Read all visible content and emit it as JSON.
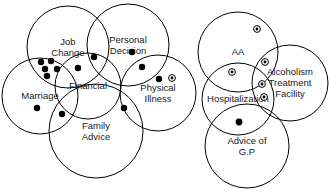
{
  "diagram": {
    "width": 329,
    "height": 194,
    "background_color": "#ffffff",
    "stroke_color": "#000000",
    "label_color": "#1a1a1a",
    "clusters": [
      {
        "name": "left-cluster",
        "circles": [
          {
            "id": "job-change",
            "label": "Job\nChange",
            "label_lines": [
              "Job",
              "Change"
            ],
            "cx": 68,
            "cy": 47,
            "r": 41
          },
          {
            "id": "personal-decision",
            "label": "Personal\nDecision",
            "label_lines": [
              "Personal",
              "Decision"
            ],
            "cx": 128,
            "cy": 45,
            "r": 41
          },
          {
            "id": "marriage",
            "label": "Marriage",
            "label_lines": [
              "Marriage"
            ],
            "cx": 40,
            "cy": 96,
            "r": 38
          },
          {
            "id": "financial",
            "label": "Financial",
            "label_lines": [
              "Financial"
            ],
            "cx": 88,
            "cy": 86,
            "r": 33
          },
          {
            "id": "physical-illness",
            "label": "Physical\nIllness",
            "label_lines": [
              "Physical",
              "Illness"
            ],
            "cx": 158,
            "cy": 93,
            "r": 38
          },
          {
            "id": "family-advice",
            "label": "Family\nAdvice",
            "label_lines": [
              "Family",
              "Advice"
            ],
            "cx": 96,
            "cy": 131,
            "r": 47
          }
        ],
        "markers": [
          {
            "type": "filled",
            "x": 41,
            "y": 62,
            "r": 3.2
          },
          {
            "type": "filled",
            "x": 51,
            "y": 61,
            "r": 3.2
          },
          {
            "type": "filled",
            "x": 45,
            "y": 69,
            "r": 3.2
          },
          {
            "type": "filled",
            "x": 57,
            "y": 69,
            "r": 3.2
          },
          {
            "type": "filled",
            "x": 47,
            "y": 76,
            "r": 3.2
          },
          {
            "type": "filled",
            "x": 78,
            "y": 68,
            "r": 3.2
          },
          {
            "type": "filled",
            "x": 94,
            "y": 57,
            "r": 3.2
          },
          {
            "type": "filled",
            "x": 132,
            "y": 52,
            "r": 3.2
          },
          {
            "type": "filled",
            "x": 142,
            "y": 67,
            "r": 3.2
          },
          {
            "type": "filled",
            "x": 159,
            "y": 79,
            "r": 3.2
          },
          {
            "type": "circled",
            "x": 172,
            "y": 78,
            "r": 3.4
          },
          {
            "type": "filled",
            "x": 124,
            "y": 108,
            "r": 3.2
          },
          {
            "type": "filled",
            "x": 37,
            "y": 108,
            "r": 3.2
          },
          {
            "type": "filled",
            "x": 62,
            "y": 114,
            "r": 3.2
          }
        ]
      },
      {
        "name": "right-cluster",
        "circles": [
          {
            "id": "aa",
            "label": "AA",
            "label_lines": [
              "AA"
            ],
            "cx": 238,
            "cy": 52,
            "r": 40
          },
          {
            "id": "alcoholism-treatment",
            "label": "Alcoholism\nTreatment\nFacility",
            "label_lines": [
              "Alcoholism",
              "Treatment",
              "Facility"
            ],
            "cx": 290,
            "cy": 83,
            "r": 38
          },
          {
            "id": "hospitalization",
            "label": "Hospitalization",
            "label_lines": [
              "Hospitalization"
            ],
            "cx": 238,
            "cy": 99,
            "r": 36
          },
          {
            "id": "advice-of-gp",
            "label": "Advice of\nG.P",
            "label_lines": [
              "Advice of",
              "G.P"
            ],
            "cx": 247,
            "cy": 146,
            "r": 42
          }
        ],
        "markers": [
          {
            "type": "circled",
            "x": 257,
            "y": 29,
            "r": 3.4
          },
          {
            "type": "circled",
            "x": 265,
            "y": 62,
            "r": 3.4
          },
          {
            "type": "circled",
            "x": 232,
            "y": 72,
            "r": 3.4
          },
          {
            "type": "circled",
            "x": 262,
            "y": 84,
            "r": 3.4
          },
          {
            "type": "circled",
            "x": 264,
            "y": 97,
            "r": 3.4
          },
          {
            "type": "filled",
            "x": 239,
            "y": 122,
            "r": 3.4
          }
        ]
      }
    ]
  }
}
